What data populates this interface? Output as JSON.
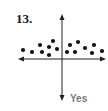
{
  "problem_number": "13.",
  "answer_label": "Yes",
  "colors": {
    "axis": "#222222",
    "dot": "#111111",
    "label": "#777777"
  },
  "chart_data": {
    "type": "scatter",
    "title": "",
    "xlabel": "",
    "ylabel": "",
    "grid": false,
    "axes": "cross with arrowheads",
    "points_px": [
      [
        23,
        50
      ],
      [
        32,
        52
      ],
      [
        40,
        45
      ],
      [
        42,
        52
      ],
      [
        49,
        47
      ],
      [
        49,
        55
      ],
      [
        53,
        41
      ],
      [
        57,
        49
      ],
      [
        67,
        52
      ],
      [
        70,
        45
      ],
      [
        75,
        52
      ],
      [
        78,
        42
      ],
      [
        85,
        48
      ],
      [
        92,
        53
      ],
      [
        94,
        45
      ],
      [
        102,
        51
      ]
    ],
    "annotation": "Yes"
  }
}
